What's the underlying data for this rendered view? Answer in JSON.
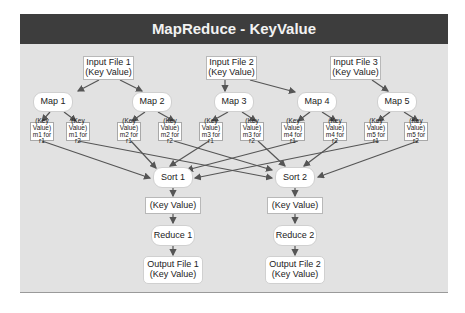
{
  "title": "MapReduce - KeyValue",
  "colors": {
    "header_bg": "#3d3d3d",
    "panel_bg": "#e2e2e2",
    "node_bg": "#ffffff",
    "edge": "#555555"
  },
  "inputs": [
    {
      "line1": "Input File 1",
      "line2": "(Key Value)"
    },
    {
      "line1": "Input File 2",
      "line2": "(Key Value)"
    },
    {
      "line1": "Input File 3",
      "line2": "(Key Value)"
    }
  ],
  "maps": [
    "Map 1",
    "Map 2",
    "Map 3",
    "Map 4",
    "Map 5"
  ],
  "intermediate": [
    {
      "line1": "(Key Value)",
      "line2": "m1 for r1"
    },
    {
      "line1": "(Key Value)",
      "line2": "m1 for r2"
    },
    {
      "line1": "(Key Value)",
      "line2": "m2 for r1"
    },
    {
      "line1": "(Key Value)",
      "line2": "m2 for r2"
    },
    {
      "line1": "(Key Value)",
      "line2": "m3 for r1"
    },
    {
      "line1": "(Key Value)",
      "line2": "m3 for r2"
    },
    {
      "line1": "(Key Value)",
      "line2": "m4 for r1"
    },
    {
      "line1": "(Key Value)",
      "line2": "m4 for r2"
    },
    {
      "line1": "(Key Value)",
      "line2": "m5 for r1"
    },
    {
      "line1": "(Key Value)",
      "line2": "m5 for r2"
    }
  ],
  "sorts": [
    "Sort 1",
    "Sort 2"
  ],
  "sorted": [
    "(Key Value)",
    "(Key Value)"
  ],
  "reduces": [
    "Reduce 1",
    "Reduce 2"
  ],
  "outputs": [
    {
      "line1": "Output File 1",
      "line2": "(Key Value)"
    },
    {
      "line1": "Output File 2",
      "line2": "(Key Value)"
    }
  ],
  "edges": [
    [
      "Input File 1",
      "Map 1"
    ],
    [
      "Input File 1",
      "Map 2"
    ],
    [
      "Input File 2",
      "Map 3"
    ],
    [
      "Input File 2",
      "Map 4"
    ],
    [
      "Input File 3",
      "Map 5"
    ],
    [
      "Map 1",
      "m1 for r1"
    ],
    [
      "Map 1",
      "m1 for r2"
    ],
    [
      "Map 2",
      "m2 for r1"
    ],
    [
      "Map 2",
      "m2 for r2"
    ],
    [
      "Map 3",
      "m3 for r1"
    ],
    [
      "Map 3",
      "m3 for r2"
    ],
    [
      "Map 4",
      "m4 for r1"
    ],
    [
      "Map 4",
      "m4 for r2"
    ],
    [
      "Map 5",
      "m5 for r1"
    ],
    [
      "Map 5",
      "m5 for r2"
    ],
    [
      "m1 for r1",
      "Sort 1"
    ],
    [
      "m2 for r1",
      "Sort 1"
    ],
    [
      "m3 for r1",
      "Sort 1"
    ],
    [
      "m4 for r1",
      "Sort 1"
    ],
    [
      "m5 for r1",
      "Sort 1"
    ],
    [
      "m1 for r2",
      "Sort 2"
    ],
    [
      "m2 for r2",
      "Sort 2"
    ],
    [
      "m3 for r2",
      "Sort 2"
    ],
    [
      "m4 for r2",
      "Sort 2"
    ],
    [
      "m5 for r2",
      "Sort 2"
    ],
    [
      "Sort 1",
      "(Key Value)"
    ],
    [
      "(Key Value)",
      "Reduce 1"
    ],
    [
      "Reduce 1",
      "Output File 1"
    ],
    [
      "Sort 2",
      "(Key Value)"
    ],
    [
      "(Key Value)",
      "Reduce 2"
    ],
    [
      "Reduce 2",
      "Output File 2"
    ]
  ]
}
